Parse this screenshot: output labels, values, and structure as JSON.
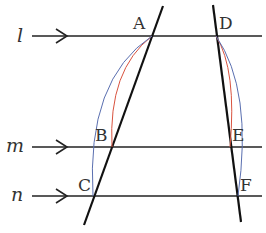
{
  "diagram": {
    "lines": [
      {
        "name": "l",
        "y": 36
      },
      {
        "name": "m",
        "y": 147
      },
      {
        "name": "n",
        "y": 196
      }
    ],
    "points": {
      "A": "A",
      "B": "B",
      "C": "C",
      "D": "D",
      "E": "E",
      "F": "F"
    },
    "colors": {
      "line": "#111111",
      "arc_red": "#d9533f",
      "arc_blue": "#5a6fb0"
    }
  }
}
